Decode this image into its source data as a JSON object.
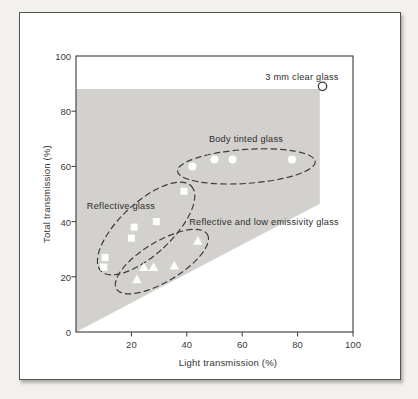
{
  "figure": {
    "x_axis_title": "Light transmission (%)",
    "y_axis_title": "Total transmission (%)"
  },
  "chart_data": {
    "type": "scatter",
    "title": "",
    "xlabel": "Light transmission (%)",
    "ylabel": "Total transmission (%)",
    "xlim": [
      0,
      100
    ],
    "ylim": [
      0,
      100
    ],
    "x_ticks": [
      20,
      40,
      60,
      80,
      100
    ],
    "y_ticks": [
      0,
      20,
      40,
      60,
      80,
      100
    ],
    "grid": false,
    "legend": "none",
    "shaded_region": {
      "color": "#d3d1ce",
      "vertices": [
        [
          0,
          0
        ],
        [
          0,
          88
        ],
        [
          88,
          88
        ],
        [
          88,
          46.5
        ]
      ]
    },
    "series": [
      {
        "name": "3 mm clear glass",
        "marker": "open-circle",
        "points": [
          [
            89,
            89
          ]
        ]
      },
      {
        "name": "Body tinted glass",
        "marker": "circle",
        "points": [
          [
            42,
            60
          ],
          [
            50,
            62.5
          ],
          [
            56.5,
            62.5
          ],
          [
            78,
            62.5
          ]
        ],
        "ellipse": {
          "cx": 61.5,
          "cy": 60,
          "rx_px": 69,
          "ry_px": 17,
          "angle_deg": -4
        }
      },
      {
        "name": "Reflective glass",
        "marker": "square",
        "points": [
          [
            10,
            23.5
          ],
          [
            10.5,
            27
          ],
          [
            20,
            34
          ],
          [
            21,
            38
          ],
          [
            29,
            40
          ],
          [
            39,
            51
          ]
        ],
        "ellipse": {
          "cx": 25.3,
          "cy": 37.5,
          "rx_px": 62,
          "ry_px": 26,
          "angle_deg": -43
        }
      },
      {
        "name": "Reflective and low emissivity glass",
        "marker": "triangle",
        "points": [
          [
            22,
            19
          ],
          [
            24.5,
            23.5
          ],
          [
            28,
            23.5
          ],
          [
            35.5,
            24
          ],
          [
            44,
            33
          ]
        ],
        "ellipse": {
          "cx": 31,
          "cy": 25.5,
          "rx_px": 53,
          "ry_px": 20,
          "angle_deg": -31
        }
      }
    ],
    "annotations": [
      {
        "text": "3 mm clear glass",
        "x_px": 302,
        "y_px": 77
      },
      {
        "text": "Body tinted glass",
        "x_px": 246,
        "y_px": 139
      },
      {
        "text": "Reflective glass",
        "x_px": 121,
        "y_px": 206
      },
      {
        "text": "Reflective and low emissivity glass",
        "x_px": 264,
        "y_px": 222
      }
    ]
  }
}
